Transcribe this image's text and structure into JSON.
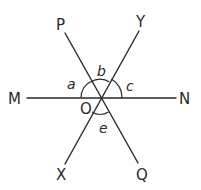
{
  "diagram": {
    "type": "intersecting-lines",
    "center_point": "O",
    "lines": [
      {
        "name": "MN",
        "from": "M",
        "to": "N"
      },
      {
        "name": "PQ",
        "from": "P",
        "to": "Q"
      },
      {
        "name": "XY",
        "from": "X",
        "to": "Y"
      }
    ],
    "point_labels": {
      "P": "P",
      "Y": "Y",
      "M": "M",
      "N": "N",
      "X": "X",
      "Q": "Q",
      "O": "O"
    },
    "angle_labels": {
      "a": "a",
      "b": "b",
      "c": "c",
      "e": "e"
    },
    "angles": [
      {
        "label": "a",
        "between": [
          "OM",
          "OP"
        ]
      },
      {
        "label": "b",
        "between": [
          "OP",
          "OY"
        ]
      },
      {
        "label": "c",
        "between": [
          "OY",
          "ON"
        ]
      },
      {
        "label": "e",
        "between": [
          "OX",
          "OQ"
        ]
      }
    ]
  }
}
